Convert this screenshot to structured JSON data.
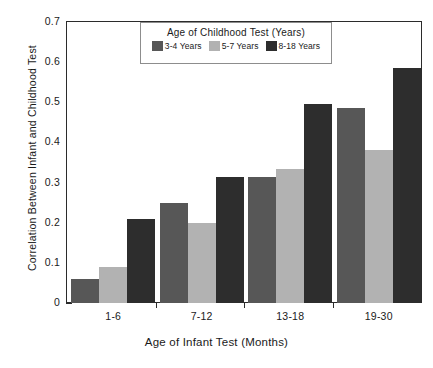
{
  "chart_data": {
    "type": "bar",
    "title": "",
    "xlabel": "Age of Infant Test (Months)",
    "ylabel": "Correlation Between Infant and Childhood Test",
    "categories": [
      "1-6",
      "7-12",
      "13-18",
      "19-30"
    ],
    "series": [
      {
        "name": "3-4 Years",
        "values": [
          0.06,
          0.25,
          0.315,
          0.485
        ],
        "color": "#575757"
      },
      {
        "name": "5-7 Years",
        "values": [
          0.09,
          0.2,
          0.335,
          0.38
        ],
        "color": "#b2b2b2"
      },
      {
        "name": "8-18 Years",
        "values": [
          0.21,
          0.315,
          0.495,
          0.585
        ],
        "color": "#2d2d2d"
      }
    ],
    "ylim": [
      0,
      0.7
    ],
    "ytick_values": [
      0,
      0.1,
      0.2,
      0.3,
      0.4,
      0.5,
      0.6,
      0.7
    ],
    "ytick_labels": [
      "0",
      "0.1",
      "0.2",
      "0.3",
      "0.4",
      "0.5",
      "0.6",
      "0.7"
    ],
    "grid": false,
    "legend_position": "top-center",
    "legend_title": "Age of Childhood Test (Years)"
  },
  "legend": {
    "title": "Age of Childhood Test (Years)",
    "entries": [
      {
        "label": "3-4 Years",
        "color": "#575757"
      },
      {
        "label": "5-7 Years",
        "color": "#b2b2b2"
      },
      {
        "label": "8-18 Years",
        "color": "#2d2d2d"
      }
    ]
  },
  "axes": {
    "x_title": "Age of Infant Test (Months)",
    "y_title": "Correlation Between Infant and Childhood Test",
    "x_categories": [
      "1-6",
      "7-12",
      "13-18",
      "19-30"
    ],
    "y_ticks": [
      "0",
      "0.1",
      "0.2",
      "0.3",
      "0.4",
      "0.5",
      "0.6",
      "0.7"
    ]
  }
}
